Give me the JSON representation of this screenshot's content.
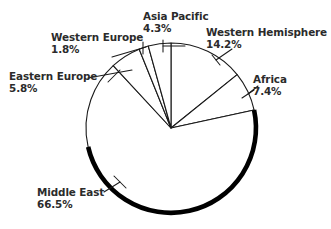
{
  "chart_data": {
    "type": "pie",
    "title": "",
    "subtitle": "",
    "xlabel": "",
    "ylabel": "",
    "legend_position": "none",
    "grid": false,
    "value_suffix": "%",
    "start_angle_deg": 0,
    "direction": "clockwise",
    "categories": [
      "Western Hemisphere",
      "Africa",
      "Middle East",
      "Eastern Europe",
      "Western Europe",
      "Asia Pacific"
    ],
    "values": [
      14.2,
      7.4,
      66.5,
      5.8,
      1.8,
      4.3
    ],
    "slices": [
      {
        "label": "Western Hemisphere",
        "value": 14.2,
        "value_text": "14.2%",
        "start_deg": 0,
        "end_deg": 51.12
      },
      {
        "label": "Africa",
        "value": 7.4,
        "value_text": "7.4%",
        "start_deg": 51.12,
        "end_deg": 77.76
      },
      {
        "label": "Middle East",
        "value": 66.5,
        "value_text": "66.5%",
        "start_deg": 77.76,
        "end_deg": 317.16
      },
      {
        "label": "Eastern Europe",
        "value": 5.8,
        "value_text": "5.8%",
        "start_deg": 317.16,
        "end_deg": 338.04
      },
      {
        "label": "Western Europe",
        "value": 1.8,
        "value_text": "1.8%",
        "start_deg": 338.04,
        "end_deg": 344.52
      },
      {
        "label": "Asia Pacific",
        "value": 4.3,
        "value_text": "4.3%",
        "start_deg": 344.52,
        "end_deg": 360
      }
    ]
  },
  "labels": {
    "asia_pacific": {
      "name": "Asia Pacific",
      "value": "4.3%"
    },
    "western_hemisphere": {
      "name": "Western Hemisphere",
      "value": "14.2%"
    },
    "western_europe": {
      "name": "Western Europe",
      "value": "1.8%"
    },
    "eastern_europe": {
      "name": "Eastern Europe",
      "value": "5.8%"
    },
    "africa": {
      "name": "Africa",
      "value": "7.4%"
    },
    "middle_east": {
      "name": "Middle East",
      "value": "66.5%"
    }
  },
  "colors": {
    "background": "#ffffff",
    "slice_fill": "#ffffff",
    "outline": "#1a1a1a",
    "rim_shadow": "#000000",
    "label_text": "#2b2b2b"
  }
}
